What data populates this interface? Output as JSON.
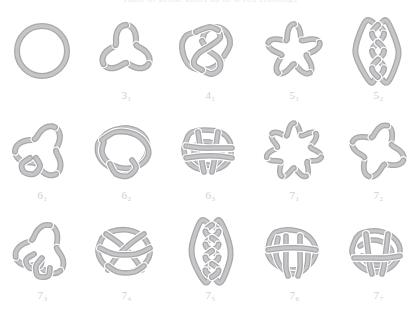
{
  "header": {
    "title": "Table of prime knots up to seven crossings"
  },
  "style": {
    "background": "#ffffff",
    "tube_fill": "#c6c6c9",
    "tube_outline": "#a9a9ac",
    "label_color": "#cfcfd3"
  },
  "grid": {
    "columns": 5,
    "rows": 3,
    "total_diagrams": 15
  },
  "knots": [
    {
      "label": "",
      "main": "",
      "sub": "",
      "name": "unknot",
      "crossings": 0,
      "art": "unknot"
    },
    {
      "label": "31",
      "main": "3",
      "sub": "1",
      "name": "trefoil-knot",
      "crossings": 3,
      "art": "k31"
    },
    {
      "label": "41",
      "main": "4",
      "sub": "1",
      "name": "figure-eight-knot",
      "crossings": 4,
      "art": "k41"
    },
    {
      "label": "51",
      "main": "5",
      "sub": "1",
      "name": "cinquefoil-knot",
      "crossings": 5,
      "art": "k51"
    },
    {
      "label": "52",
      "main": "5",
      "sub": "2",
      "name": "three-twist-knot",
      "crossings": 5,
      "art": "k52"
    },
    {
      "label": "61",
      "main": "6",
      "sub": "1",
      "name": "stevedore-knot",
      "crossings": 6,
      "art": "k61"
    },
    {
      "label": "62",
      "main": "6",
      "sub": "2",
      "name": "six-two-knot",
      "crossings": 6,
      "art": "k62"
    },
    {
      "label": "63",
      "main": "6",
      "sub": "3",
      "name": "six-three-knot",
      "crossings": 6,
      "art": "k63"
    },
    {
      "label": "71",
      "main": "7",
      "sub": "1",
      "name": "septafoil-knot",
      "crossings": 7,
      "art": "k71"
    },
    {
      "label": "72",
      "main": "7",
      "sub": "2",
      "name": "seven-two-knot",
      "crossings": 7,
      "art": "k72"
    },
    {
      "label": "73",
      "main": "7",
      "sub": "3",
      "name": "seven-three-knot",
      "crossings": 7,
      "art": "k73"
    },
    {
      "label": "74",
      "main": "7",
      "sub": "4",
      "name": "seven-four-knot",
      "crossings": 7,
      "art": "k74"
    },
    {
      "label": "75",
      "main": "7",
      "sub": "5",
      "name": "seven-five-knot",
      "crossings": 7,
      "art": "k75"
    },
    {
      "label": "76",
      "main": "7",
      "sub": "6",
      "name": "seven-six-knot",
      "crossings": 7,
      "art": "k76"
    },
    {
      "label": "77",
      "main": "7",
      "sub": "7",
      "name": "seven-seven-knot",
      "crossings": 7,
      "art": "k77"
    }
  ]
}
